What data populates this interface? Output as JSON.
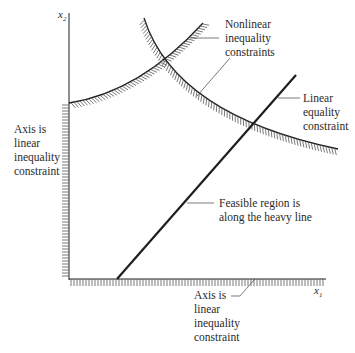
{
  "diagram": {
    "type": "constraint-region-diagram",
    "axes": {
      "x_label": "x",
      "x_subscript": "1",
      "y_label": "x",
      "y_subscript": "2"
    },
    "labels": {
      "nonlinear": [
        "Nonlinear",
        "inequality",
        "constraints"
      ],
      "linear_equality": [
        "Linear",
        "equality",
        "constraint"
      ],
      "feasible": [
        "Feasible region is",
        "along the heavy line"
      ],
      "y_axis_constraint": [
        "Axis is",
        "linear",
        "inequality",
        "constraint"
      ],
      "x_axis_constraint": [
        "Axis is",
        "linear",
        "inequality",
        "constraint"
      ]
    },
    "colors": {
      "line": "#1e1e1e",
      "hatch": "#555555",
      "pointer": "#444444",
      "text": "#2a2a2a"
    }
  }
}
